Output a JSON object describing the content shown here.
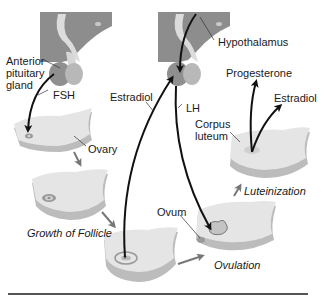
{
  "labels": {
    "anterior_pituitary": [
      "Anterior",
      "pituitary",
      "gland"
    ],
    "hypothalamus": "Hypothalamus",
    "fsh": "FSH",
    "lh": "LH",
    "estradiol_left": "Estradiol",
    "progesterone": "Progesterone",
    "estradiol_right": "Estradiol",
    "corpus_luteum": [
      "Corpus",
      "luteum"
    ],
    "ovary": "Ovary",
    "ovum": "Ovum",
    "growth_of_follicle": "Growth of Follicle",
    "ovulation": "Ovulation",
    "luteinization": "Luteinization"
  },
  "colors": {
    "brain_tissue": "#8a8a8a",
    "pituitary": "#9a9a9a",
    "stalk": "#d8d8d8",
    "ovary_top": "#e4e4e4",
    "ovary_side": "#bdbdbd",
    "arrow_black": "#111111",
    "arrow_gray": "#777777",
    "rule": "#555555"
  },
  "stages": [
    "Ovary",
    "Growth of Follicle",
    "Mature follicle",
    "Ovulation",
    "Luteinization"
  ]
}
